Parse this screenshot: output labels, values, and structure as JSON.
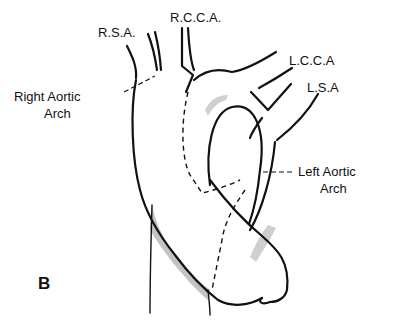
{
  "figure": {
    "panel_label": "B",
    "labels": {
      "rsa": "R.S.A.",
      "rcca": "R.C.C.A.",
      "lcca": "L.C.C.A",
      "lsa": "L.S.A",
      "right_arch_line1": "Right Aortic",
      "right_arch_line2": "Arch",
      "left_arch_line1": "Left Aortic",
      "left_arch_line2": "Arch"
    }
  }
}
